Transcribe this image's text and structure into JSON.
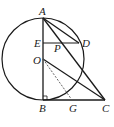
{
  "diagram": {
    "type": "geometry",
    "labels": {
      "A": "A",
      "B": "B",
      "C": "C",
      "D": "D",
      "E": "E",
      "O": "O",
      "P": "P",
      "G": "G"
    },
    "points": {
      "A": [
        43,
        18
      ],
      "B": [
        43,
        100
      ],
      "C": [
        105,
        100
      ],
      "D": [
        79,
        43
      ],
      "E": [
        43,
        43
      ],
      "O": [
        43,
        59
      ],
      "P": [
        57,
        43
      ],
      "G": [
        72,
        100
      ]
    },
    "circle": {
      "center": "O",
      "radius": 41
    },
    "segments": [
      "AB",
      "BC",
      "AC",
      "AD",
      "ED",
      "OC"
    ],
    "dashed_segments": [
      "OG"
    ],
    "right_angle_at": "B",
    "colors": {
      "stroke": "#1a1a1a",
      "dashed": "#555555"
    }
  }
}
